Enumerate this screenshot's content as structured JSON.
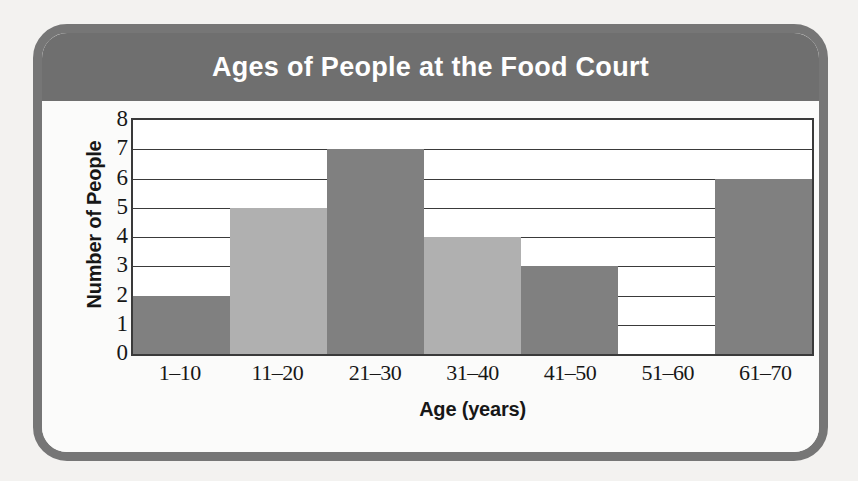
{
  "chart_data": {
    "type": "bar",
    "title": "Ages of People at the Food Court",
    "xlabel": "Age (years)",
    "ylabel": "Number of People",
    "categories": [
      "1–10",
      "11–20",
      "21–30",
      "31–40",
      "41–50",
      "51–60",
      "61–70"
    ],
    "values": [
      2,
      5,
      7,
      4,
      3,
      0,
      6
    ],
    "bar_colors": [
      "#808080",
      "#b0b0b0",
      "#808080",
      "#b0b0b0",
      "#808080",
      "#ffffff",
      "#808080"
    ],
    "ylim": [
      0,
      8
    ],
    "ytick_labels": [
      "0",
      "1",
      "2",
      "3",
      "4",
      "5",
      "6",
      "7",
      "8"
    ],
    "ytick_values": [
      0,
      1,
      2,
      3,
      4,
      5,
      6,
      7,
      8
    ],
    "grid": true,
    "grid_axis": "y",
    "legend": "none",
    "bar_gap": 0
  },
  "style": {
    "title_banner_color": "#6f6f6f",
    "title_text_color": "#ffffff",
    "frame_border_color": "#767676",
    "axis_color": "#3a3a3a",
    "plot_background": "#ffffff",
    "page_background": "#f3f2f0",
    "bar_dark": "#808080",
    "bar_light": "#b0b0b0"
  }
}
